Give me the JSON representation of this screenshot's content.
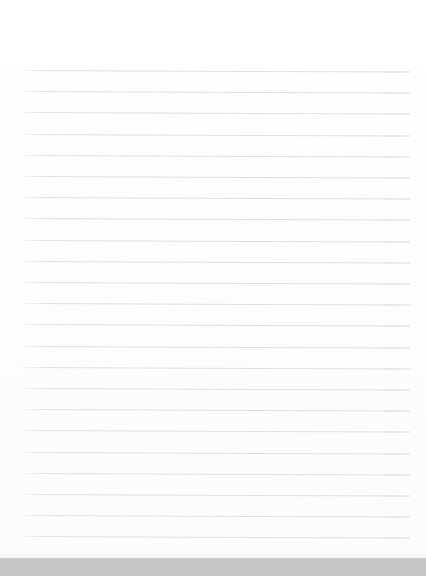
{
  "document": {
    "kind": "lined-paper-page",
    "title": "",
    "body_text": "",
    "is_blank": true,
    "page_background_color": "#ffffff",
    "page_width_px": 426,
    "page_height_px": 558
  },
  "ruling": {
    "line_color": "#dededf",
    "line_thickness_px": 1,
    "line_spacing_px": 21.2,
    "first_line_y_px": 70,
    "last_line_y_px": 536,
    "line_left_x_px": 23,
    "line_right_x_px": 410,
    "line_count": 23,
    "tilt_degrees": 0.22,
    "vertical_margin_rule": "none"
  },
  "surface": {
    "band_color": "#c4c5c7",
    "band_top_y_px": 558,
    "band_height_px": 18
  },
  "annotations": {
    "text_entries": [],
    "handwriting": "none",
    "header": "",
    "footer": "",
    "page_number": ""
  }
}
